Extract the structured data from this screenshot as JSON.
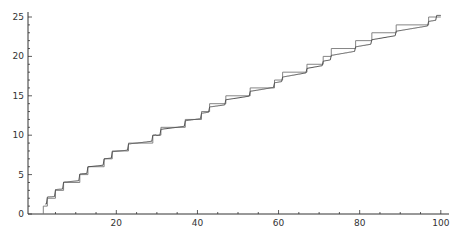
{
  "chart_data": {
    "type": "line",
    "title": "",
    "xlabel": "",
    "ylabel": "",
    "xlim": [
      2,
      100
    ],
    "ylim": [
      0,
      25
    ],
    "grid": false,
    "legend": null,
    "x_ticks": [
      20,
      40,
      60,
      80,
      100
    ],
    "y_ticks": [
      0,
      5,
      10,
      15,
      20,
      25
    ],
    "series": [
      {
        "name": "prime counting step function",
        "style": "step",
        "primes": [
          2,
          3,
          5,
          7,
          11,
          13,
          17,
          19,
          23,
          29,
          31,
          37,
          41,
          43,
          47,
          53,
          59,
          61,
          67,
          71,
          73,
          79,
          83,
          89,
          97
        ],
        "x": [
          2,
          3,
          5,
          7,
          11,
          13,
          17,
          19,
          23,
          29,
          31,
          37,
          41,
          43,
          47,
          53,
          59,
          61,
          67,
          71,
          73,
          79,
          83,
          89,
          97,
          100
        ],
        "values": [
          1,
          2,
          3,
          4,
          5,
          6,
          7,
          8,
          9,
          10,
          11,
          12,
          13,
          14,
          15,
          16,
          17,
          18,
          19,
          20,
          21,
          22,
          23,
          24,
          25,
          25
        ]
      },
      {
        "name": "smooth approximation",
        "style": "line",
        "x": [
          2,
          10,
          20,
          30,
          40,
          50,
          60,
          70,
          80,
          90,
          100
        ],
        "values": [
          0.5,
          4,
          8,
          10,
          12,
          15,
          17,
          19.5,
          22,
          24,
          25.2
        ]
      }
    ]
  },
  "colors": {
    "step": "#777777",
    "smooth": "#555555",
    "axis": "#333333"
  }
}
